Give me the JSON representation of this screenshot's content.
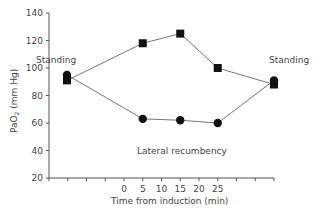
{
  "chart_data": {
    "type": "line",
    "title": "",
    "xlabel": "Time from induction (min)",
    "ylabel": "PaO2 (mm Hg)",
    "ylabel_main": "PaO",
    "ylabel_sub": "2",
    "ylabel_rest": " (mm Hg)",
    "ylim": [
      20,
      140
    ],
    "yticks": [
      20,
      40,
      60,
      80,
      100,
      120,
      140
    ],
    "xtick_labels": [
      "",
      "",
      "",
      "",
      "0",
      "5",
      "10",
      "15",
      "20",
      "25",
      "",
      "",
      ""
    ],
    "x_positions": [
      "Standing (pre)",
      "5",
      "15",
      "25",
      "Standing (post)"
    ],
    "grid": false,
    "legend": null,
    "series": [
      {
        "name": "Square markers",
        "marker": "square",
        "x": [
          "Standing (pre)",
          5,
          15,
          25,
          "Standing (post)"
        ],
        "values": [
          91,
          118,
          125,
          100,
          88
        ]
      },
      {
        "name": "Circle markers",
        "marker": "circle",
        "x": [
          "Standing (pre)",
          5,
          15,
          25,
          "Standing (post)"
        ],
        "values": [
          95,
          63,
          62,
          60,
          91
        ]
      }
    ],
    "annotations": [
      {
        "text": "Standing",
        "position": "left"
      },
      {
        "text": "Standing",
        "position": "right"
      },
      {
        "text": "Lateral recumbency",
        "position": "center-bottom"
      }
    ]
  }
}
